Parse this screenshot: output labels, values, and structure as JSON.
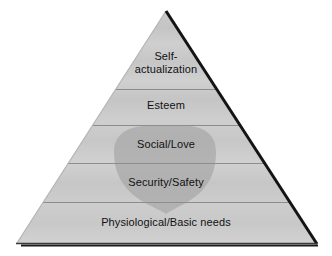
{
  "figure": {
    "type": "pyramid-diagram",
    "background_color": "#ffffff",
    "outline_color": "#111111",
    "tier_fill_color": "#c9c9c9",
    "tier_divider_color": "#8d8d8d",
    "overlay_shape_color": "#a8a8a8",
    "overlay_shape_name": "shield-overlay"
  },
  "pyramid": {
    "apex": {
      "x": 166,
      "y": 11
    },
    "base_left": {
      "x": 17,
      "y": 243
    },
    "base_right": {
      "x": 316,
      "y": 243
    },
    "divider_y": [
      89,
      125,
      163,
      202
    ],
    "tiers": [
      {
        "id": "self-actualization",
        "label": "Self-\nactualization",
        "level": 5
      },
      {
        "id": "esteem",
        "label": "Esteem",
        "level": 4
      },
      {
        "id": "social-love",
        "label": "Social/Love",
        "level": 3
      },
      {
        "id": "security-safety",
        "label": "Security/Safety",
        "level": 2
      },
      {
        "id": "physiological",
        "label": "Physiological/Basic needs",
        "level": 1
      }
    ]
  }
}
